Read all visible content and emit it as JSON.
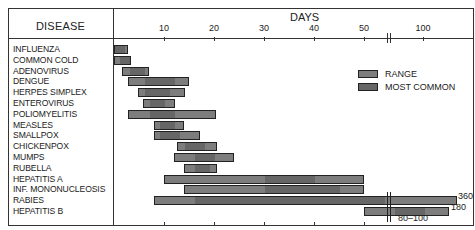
{
  "header": {
    "disease_label": "DISEASE",
    "days_label": "DAYS"
  },
  "axis": {
    "ticks": [
      {
        "label": "10",
        "x": 164
      },
      {
        "label": "20",
        "x": 214
      },
      {
        "label": "30",
        "x": 264
      },
      {
        "label": "40",
        "x": 314
      },
      {
        "label": "50",
        "x": 364
      },
      {
        "label": "100",
        "x": 423
      }
    ]
  },
  "legend": {
    "range": "RANGE",
    "most_common": "MOST COMMON"
  },
  "colors": {
    "range": "#7d7d7d",
    "most_common": "#666666",
    "border": "#222222"
  },
  "annotations": {
    "rabies_max": "360",
    "hepb_max": "180",
    "hepb_common": "80–100"
  },
  "chart_data": {
    "type": "bar",
    "orientation": "horizontal-range",
    "title": "",
    "xlabel": "DAYS",
    "ylabel": "DISEASE",
    "x_ticks": [
      "10",
      "20",
      "30",
      "40",
      "50",
      "100"
    ],
    "axis_break": "between 50 and 100",
    "legend": [
      "RANGE",
      "MOST COMMON"
    ],
    "categories": [
      "INFLUENZA",
      "COMMON COLD",
      "ADENOVIRUS",
      "DENGUE",
      "HERPES SIMPLEX",
      "ENTEROVIRUS",
      "POLIOMYELITIS",
      "MEASLES",
      "SMALLPOX",
      "CHICKENPOX",
      "MUMPS",
      "RUBELLA",
      "HEPATITIS A",
      "INF. MONONUCLEOSIS",
      "RABIES",
      "HEPATITIS B"
    ],
    "series": [
      {
        "name": "RANGE",
        "values": [
          [
            0,
            3
          ],
          [
            0,
            3.5
          ],
          [
            2,
            7
          ],
          [
            3,
            15
          ],
          [
            5,
            14
          ],
          [
            6,
            12
          ],
          [
            3,
            20
          ],
          [
            8,
            14
          ],
          [
            8,
            17
          ],
          [
            13,
            21
          ],
          [
            12,
            24
          ],
          [
            14,
            21
          ],
          [
            10,
            50
          ],
          [
            14,
            50
          ],
          [
            8,
            360
          ],
          [
            50,
            180
          ]
        ]
      },
      {
        "name": "MOST COMMON",
        "values": [
          [
            0,
            2
          ],
          [
            1,
            3
          ],
          [
            3,
            6
          ],
          [
            6,
            12
          ],
          [
            6,
            11
          ],
          [
            7,
            10
          ],
          [
            7,
            12
          ],
          [
            9,
            12
          ],
          [
            9,
            13
          ],
          [
            14,
            18
          ],
          [
            16,
            20
          ],
          [
            16,
            19
          ],
          [
            30,
            40
          ],
          [
            30,
            45
          ],
          [
            15,
            60
          ],
          [
            80,
            100
          ]
        ]
      }
    ],
    "annotations": [
      "360",
      "180",
      "80–100"
    ]
  },
  "rows": [
    {
      "label": "INFLUENZA",
      "x1": 114,
      "x2": 128,
      "m1": 114,
      "m2": 124
    },
    {
      "label": "COMMON COLD",
      "x1": 114,
      "x2": 131,
      "m1": 119,
      "m2": 129
    },
    {
      "label": "ADENOVIRUS",
      "x1": 122,
      "x2": 149,
      "m1": 129,
      "m2": 144
    },
    {
      "label": "DENGUE",
      "x1": 128,
      "x2": 189,
      "m1": 144,
      "m2": 174
    },
    {
      "label": "HERPES SIMPLEX",
      "x1": 138,
      "x2": 185,
      "m1": 144,
      "m2": 169
    },
    {
      "label": "ENTEROVIRUS",
      "x1": 143,
      "x2": 175,
      "m1": 149,
      "m2": 164
    },
    {
      "label": "POLIOMYELITIS",
      "x1": 128,
      "x2": 216,
      "m1": 149,
      "m2": 174
    },
    {
      "label": "MEASLES",
      "x1": 154,
      "x2": 184,
      "m1": 159,
      "m2": 174
    },
    {
      "label": "SMALLPOX",
      "x1": 154,
      "x2": 200,
      "m1": 159,
      "m2": 179
    },
    {
      "label": "CHICKENPOX",
      "x1": 177,
      "x2": 217,
      "m1": 184,
      "m2": 204
    },
    {
      "label": "MUMPS",
      "x1": 174,
      "x2": 234,
      "m1": 194,
      "m2": 214
    },
    {
      "label": "RUBELLA",
      "x1": 184,
      "x2": 217,
      "m1": 194,
      "m2": 209
    },
    {
      "label": "HEPATITIS A",
      "x1": 164,
      "x2": 364,
      "m1": 264,
      "m2": 314
    },
    {
      "label": "INF. MONONUCLEOSIS",
      "x1": 184,
      "x2": 364,
      "m1": 264,
      "m2": 339
    },
    {
      "label": "RABIES",
      "x1": 154,
      "x2": 457,
      "m1": 194,
      "m2": 384
    },
    {
      "label": "HEPATITIS B",
      "x1": 364,
      "x2": 449,
      "m1": 394,
      "m2": 424
    }
  ]
}
